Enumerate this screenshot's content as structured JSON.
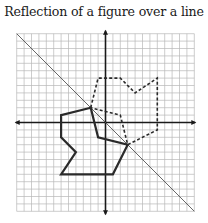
{
  "title": "Reflection of a figure over a line",
  "chart_data": {
    "type": "diagram",
    "title": "Reflection of a figure over a line",
    "grid": {
      "xmin": -12,
      "xmax": 12,
      "ymin": -12,
      "ymax": 12,
      "step": 1,
      "visible": true
    },
    "axes": {
      "x_axis": true,
      "y_axis": true,
      "arrows": true
    },
    "reflection_line": {
      "equation": "y = -x",
      "from": [
        -12,
        12
      ],
      "to": [
        12,
        -12
      ]
    },
    "original_figure": {
      "style": "solid",
      "vertices": [
        [
          -2,
          2
        ],
        [
          -6,
          1
        ],
        [
          -6,
          -2
        ],
        [
          -4,
          -4
        ],
        [
          -6,
          -7
        ],
        [
          1,
          -7
        ],
        [
          3,
          -3
        ],
        [
          -1,
          -2
        ]
      ]
    },
    "reflected_figure": {
      "style": "dashed",
      "vertices": [
        [
          -2,
          2
        ],
        [
          -1,
          6
        ],
        [
          2,
          6
        ],
        [
          4,
          4
        ],
        [
          7,
          6
        ],
        [
          7,
          -1
        ],
        [
          3,
          -3
        ],
        [
          2,
          1
        ]
      ]
    }
  },
  "colors": {
    "grid": "#b8b8b8",
    "axis": "#1a1a1a",
    "figure": "#2a2a2a",
    "reflection_line": "#555555"
  }
}
